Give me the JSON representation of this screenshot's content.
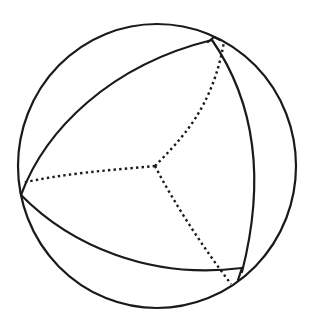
{
  "diagram": {
    "colors": {
      "stroke": "#1a1a1a",
      "background": "#ffffff"
    },
    "sphere": {
      "cx": 157,
      "cy": 166,
      "rx": 139,
      "ry": 142
    },
    "center": {
      "x": 155,
      "y": 166
    },
    "vertices": [
      {
        "name": "top-right",
        "x": 212,
        "y": 40
      },
      {
        "name": "left",
        "x": 21,
        "y": 195
      },
      {
        "name": "bottom-right",
        "x": 242,
        "y": 272
      }
    ]
  }
}
